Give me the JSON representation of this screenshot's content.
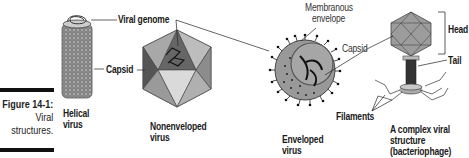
{
  "figure": {
    "number": "Figure 14-1:",
    "caption_line1": "Viral",
    "caption_line2": "structures."
  },
  "labels": {
    "viral_genome": "Viral genome",
    "capsid_left": "Capsid",
    "membranous_envelope_line1": "Membranous",
    "membranous_envelope_line2": "envelope",
    "capsid_right": "Capsid",
    "head": "Head",
    "tail": "Tail",
    "filaments": "Filaments"
  },
  "virus_types": [
    {
      "line1": "Helical",
      "line2": "virus"
    },
    {
      "line1": "Nonenveloped",
      "line2": "virus"
    },
    {
      "line1": "Enveloped",
      "line2": "virus"
    },
    {
      "line1": "A complex viral",
      "line2": "structure",
      "line3": "(bacteriophage)"
    }
  ],
  "colors": {
    "dark_gray": "#555555",
    "mid_gray": "#8a8a8a",
    "light_gray": "#bdbdbd",
    "pale_gray": "#d9d9d9",
    "ink": "#111111"
  }
}
